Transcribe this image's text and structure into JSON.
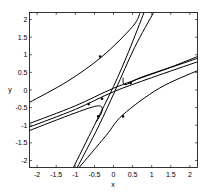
{
  "chart_data": {
    "type": "line",
    "title": "",
    "xlabel": "x",
    "ylabel": "y",
    "xlim": [
      -2.2,
      2.2
    ],
    "ylim": [
      -2.2,
      2.2
    ],
    "grid": false,
    "legend": null,
    "xticks": [
      -2,
      -1.5,
      -1,
      -0.5,
      0,
      0.5,
      1,
      1.5,
      2
    ],
    "yticks": [
      -2,
      -1.5,
      -1,
      -0.5,
      0,
      0.5,
      1,
      1.5,
      2
    ],
    "xtick_labels": [
      "-2",
      "-1.5",
      "-1",
      "-0.5",
      "0",
      "0.5",
      "1",
      "1.5",
      "2"
    ],
    "ytick_labels": [
      "-2",
      "-1.5",
      "-1",
      "-0.5",
      "0",
      "0.5",
      "1",
      "1.5",
      "2"
    ],
    "series": [
      {
        "name": "upper-left trajectory",
        "points": [
          [
            -2.2,
            -0.35
          ],
          [
            -1.2,
            0.25
          ],
          [
            -0.3,
            0.95
          ],
          [
            0.5,
            1.8
          ],
          [
            0.7,
            2.2
          ]
        ],
        "arrow_at": [
          -0.35,
          0.95
        ]
      },
      {
        "name": "steep separatrix A",
        "points": [
          [
            -1.05,
            -2.2
          ],
          [
            -0.5,
            -1.0
          ],
          [
            0,
            0.1
          ],
          [
            0.4,
            1.1
          ],
          [
            0.8,
            2.2
          ]
        ],
        "arrow_at": [
          -0.4,
          -0.75
        ]
      },
      {
        "name": "steep separatrix B",
        "points": [
          [
            -0.95,
            -2.2
          ],
          [
            -0.4,
            -1.05
          ],
          [
            0.05,
            0.0
          ],
          [
            0.55,
            1.2
          ],
          [
            1.05,
            2.2
          ]
        ]
      },
      {
        "name": "upper-right branch",
        "points": [
          [
            0.25,
            0.35
          ],
          [
            0.3,
            0.15
          ],
          [
            0.7,
            0.35
          ],
          [
            1.5,
            0.65
          ],
          [
            2.2,
            0.95
          ]
        ]
      },
      {
        "name": "shallow bundle 1",
        "points": [
          [
            -2.2,
            -0.95
          ],
          [
            -1.0,
            -0.45
          ],
          [
            0,
            0.05
          ],
          [
            1.0,
            0.45
          ],
          [
            2.2,
            0.9
          ]
        ],
        "arrow_at": [
          -0.3,
          -0.25
        ]
      },
      {
        "name": "shallow bundle 2",
        "points": [
          [
            -2.2,
            -1.05
          ],
          [
            -1.0,
            -0.55
          ],
          [
            0,
            -0.05
          ],
          [
            1.0,
            0.35
          ],
          [
            2.2,
            0.8
          ]
        ],
        "arrow_at": [
          0.45,
          0.2
        ]
      },
      {
        "name": "lower-left branch",
        "points": [
          [
            -2.2,
            -1.15
          ],
          [
            -1.0,
            -0.65
          ],
          [
            -0.4,
            -0.45
          ],
          [
            -0.3,
            -0.6
          ],
          [
            -0.45,
            -0.9
          ]
        ],
        "arrow_at": [
          -0.65,
          -0.4
        ]
      },
      {
        "name": "lower-right trajectory",
        "points": [
          [
            -0.9,
            -2.2
          ],
          [
            -0.2,
            -1.3
          ],
          [
            0.25,
            -0.7
          ],
          [
            1.2,
            0.05
          ],
          [
            2.2,
            0.55
          ]
        ],
        "arrow_at": [
          0.25,
          -0.75
        ]
      }
    ]
  }
}
